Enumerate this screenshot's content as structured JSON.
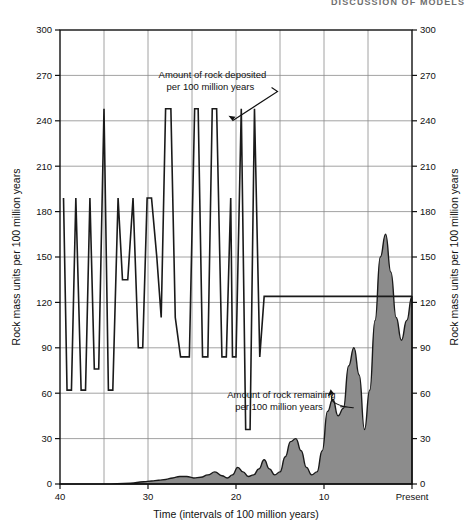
{
  "page": {
    "running_head": "DISCUSSION OF MODELS"
  },
  "chart_data": {
    "type": "area",
    "title": "",
    "xlabel": "Time (intervals of 100 million years)",
    "ylabel": "Rock mass units per 100 million years",
    "ylabel_right": "Rock mass units per 100 million years",
    "xlim": [
      40,
      0
    ],
    "ylim": [
      0,
      300
    ],
    "grid": true,
    "legend_position": "none",
    "x_ticks": [
      40,
      30,
      20,
      10,
      0
    ],
    "x_tick_labels": [
      "40",
      "30",
      "20",
      "10",
      "Present"
    ],
    "y_ticks": [
      0,
      30,
      60,
      90,
      120,
      150,
      180,
      210,
      240,
      270,
      300
    ],
    "y_tick_labels": [
      "0",
      "30",
      "60",
      "90",
      "120",
      "150",
      "180",
      "210",
      "240",
      "270",
      "300"
    ],
    "colors": {
      "line": "#1a1a1a",
      "fill": "#8c8c8c",
      "grid": "#8a8a8a",
      "axis": "#111111"
    },
    "annotations": [
      {
        "name": "deposited-annotation",
        "text_line1": "Amount of rock deposited",
        "text_line2": "per 100 million years",
        "text_x": 28.8,
        "text_y": 268,
        "pointer_from": [
          21.4,
          258
        ],
        "pointer_to": [
          20.4,
          240
        ]
      },
      {
        "name": "remaining-annotation",
        "text_line1": "Amount of rock remaining",
        "text_line2": "per 100 million years",
        "text_x": 21.0,
        "text_y": 57,
        "pointer_from": [
          13.2,
          44
        ],
        "pointer_to": [
          8.9,
          60
        ]
      }
    ],
    "series": [
      {
        "name": "Amount of rock deposited per 100 million years",
        "style": "line",
        "x": [
          39.6,
          39.2,
          38.7,
          38.2,
          37.6,
          37.1,
          36.6,
          36.1,
          35.6,
          35.0,
          34.5,
          34.0,
          33.4,
          32.9,
          32.3,
          31.7,
          31.1,
          30.6,
          30.1,
          29.6,
          29.0,
          28.5,
          28.0,
          27.4,
          26.9,
          26.3,
          25.8,
          25.3,
          24.7,
          24.3,
          23.8,
          23.2,
          22.7,
          22.2,
          21.6,
          21.1,
          20.6,
          20.4,
          20.0,
          19.4,
          18.9,
          18.4,
          17.9,
          17.3,
          16.8,
          16.3,
          15.7,
          15.2,
          14.7,
          14.1,
          13.6,
          13.0,
          12.5,
          12.0,
          11.4,
          10.9,
          10.4,
          9.8,
          9.3,
          8.8,
          8.2,
          7.7,
          7.2,
          6.6,
          6.1,
          5.6,
          5.0,
          4.5,
          4.0,
          3.4,
          2.9,
          2.4,
          1.8,
          1.3,
          0.8,
          0.3,
          0.0
        ],
        "values": [
          189,
          62,
          62,
          189,
          62,
          62,
          189,
          76,
          76,
          248,
          62,
          62,
          189,
          135,
          135,
          189,
          90,
          90,
          189,
          189,
          150,
          110,
          248,
          248,
          110,
          84,
          84,
          84,
          248,
          248,
          84,
          84,
          248,
          248,
          84,
          84,
          189,
          84,
          84,
          248,
          36,
          36,
          248,
          84,
          124,
          124,
          124,
          124,
          124,
          124,
          124,
          124,
          124,
          124,
          124,
          124,
          124,
          124,
          124,
          124,
          124,
          124,
          124,
          124,
          124,
          124,
          124,
          124,
          124,
          124,
          124,
          124,
          124,
          124,
          124,
          124,
          124
        ]
      },
      {
        "name": "Amount of rock remaining per 100 million years",
        "style": "filled-area",
        "x": [
          40.0,
          35.0,
          32.0,
          30.5,
          29.6,
          28.8,
          28.0,
          27.2,
          26.4,
          25.6,
          24.8,
          24.0,
          23.2,
          22.4,
          21.6,
          21.0,
          20.4,
          19.8,
          19.2,
          18.6,
          18.0,
          17.4,
          16.8,
          16.2,
          15.6,
          15.0,
          14.4,
          13.8,
          13.2,
          12.6,
          12.0,
          11.4,
          10.8,
          10.2,
          9.6,
          9.0,
          8.4,
          7.8,
          7.2,
          6.6,
          6.0,
          5.4,
          4.8,
          4.2,
          3.6,
          3.0,
          2.4,
          1.8,
          1.2,
          0.6,
          0.0
        ],
        "values": [
          0,
          0,
          0.5,
          1.5,
          2.0,
          2.5,
          3.0,
          4.0,
          5.0,
          5.0,
          4.0,
          4.5,
          6.0,
          8.0,
          5.5,
          4.0,
          6.0,
          11.0,
          8.0,
          5.0,
          6.0,
          10.0,
          16.0,
          10.0,
          6.0,
          8.0,
          18.0,
          28.0,
          30.0,
          22.0,
          11.0,
          6.0,
          8.0,
          22.0,
          48.0,
          56.0,
          45.0,
          50.0,
          78.0,
          90.0,
          72.0,
          36.0,
          62.0,
          108.0,
          150.0,
          165.0,
          140.0,
          110.0,
          95.0,
          108.0,
          124.0
        ]
      }
    ]
  }
}
